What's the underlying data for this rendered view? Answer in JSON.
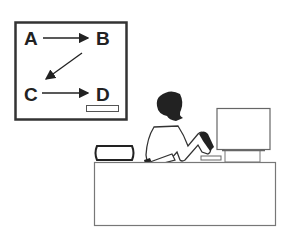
{
  "illustration": {
    "diagram": {
      "nodes": [
        {
          "label": "A"
        },
        {
          "label": "B"
        },
        {
          "label": "C"
        },
        {
          "label": "D"
        }
      ],
      "edges": [
        {
          "from": "A",
          "to": "B"
        },
        {
          "from": "B",
          "to": "C"
        },
        {
          "from": "C",
          "to": "D"
        }
      ]
    },
    "scene": "person seated at desk with computer monitor, book on desk"
  }
}
